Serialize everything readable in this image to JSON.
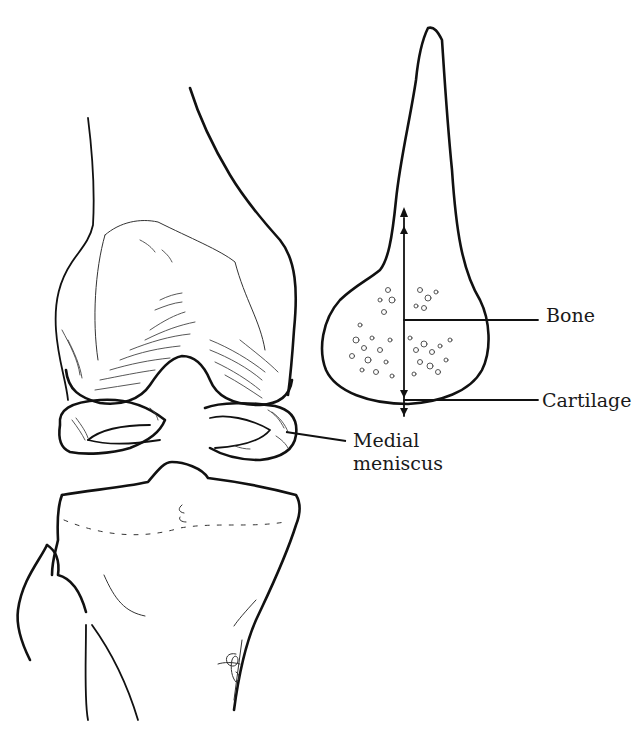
{
  "diagram": {
    "type": "anatomical illustration",
    "labels": {
      "bone": "Bone",
      "cartilage": "Cartilage",
      "medial_meniscus_line1": "Medial",
      "medial_meniscus_line2": "meniscus"
    },
    "signature": "dBP",
    "colors": {
      "line": "#111111",
      "background": "#ffffff"
    }
  }
}
